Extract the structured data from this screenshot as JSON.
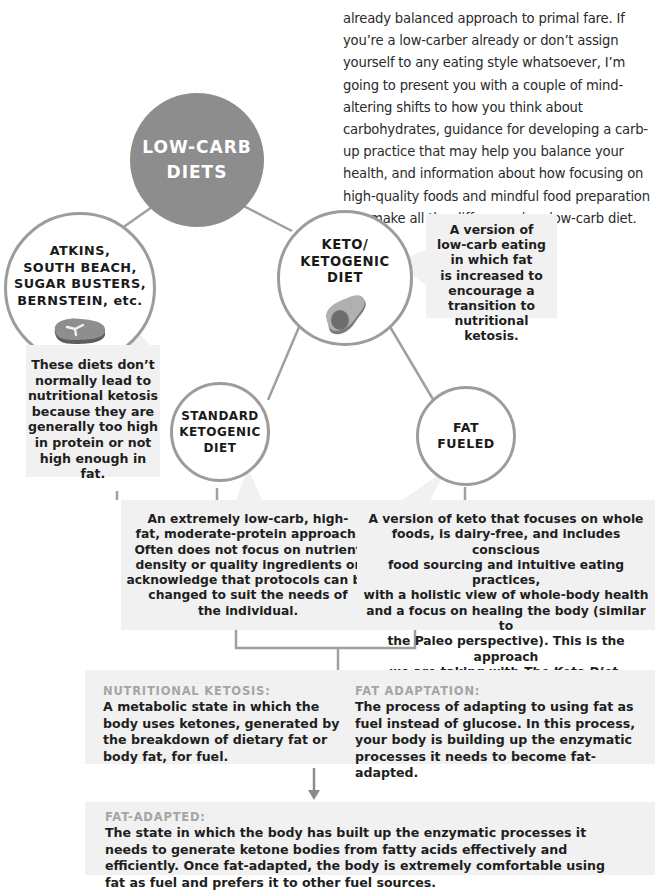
{
  "intro_paragraph": "already balanced approach to primal fare. If you’re a low-carber already or don’t assign yourself to any eating style whatsoever, I’m going to present you with a couple of mind-altering shifts to how you think about carbohydrates, guidance for developing a carb-up practice that may help you balance your health, and information about how focusing on high-quality foods and mindful food preparation can make all the difference in a low-carb diet.",
  "root": {
    "label_line1": "LOW-CARB",
    "label_line2": "DIETS"
  },
  "atkins": {
    "label_lines": [
      "ATKINS,",
      "SOUTH BEACH,",
      "SUGAR BUSTERS,",
      "BERNSTEIN, etc."
    ],
    "icon": "steak-icon",
    "description_lines": [
      "These diets don’t",
      "normally lead to",
      "nutritional ketosis",
      "because they are",
      "generally too high",
      "in protein or not",
      "high enough in fat."
    ]
  },
  "keto": {
    "label_lines": [
      "KETO/",
      "KETOGENIC",
      "DIET"
    ],
    "icon": "avocado-icon",
    "description_lines": [
      "A version of",
      "low-carb eating",
      "in which fat",
      "is increased to",
      "encourage a",
      "transition to",
      "nutritional ketosis."
    ]
  },
  "standard": {
    "label_lines": [
      "STANDARD",
      "KETOGENIC",
      "DIET"
    ],
    "description_lines": [
      "An extremely low-carb, high-",
      "fat, moderate-protein approach.",
      "Often does not focus on nutrient",
      "density or quality ingredients or",
      "acknowledge that protocols can be",
      "changed to suit the needs of",
      "the individual."
    ]
  },
  "fat_fueled": {
    "label_lines": [
      "FAT",
      "FUELED"
    ],
    "description_lines": [
      "A version of keto that focuses on whole",
      "foods, is dairy-free, and includes conscious",
      "food sourcing and intuitive eating practices,",
      "with a holistic view of whole-body health",
      "and a focus on healing the body (similar to",
      "the Paleo perspective). This is the approach"
    ],
    "description_last_prefix": "we are taking with ",
    "description_last_italic": "The Keto Diet",
    "description_last_suffix": "."
  },
  "definitions": {
    "nutritional_ketosis": {
      "title": "NUTRITIONAL KETOSIS:",
      "body": "A metabolic state in which the body uses ketones, generated by the breakdown of dietary fat or body fat, for fuel."
    },
    "fat_adaptation": {
      "title": "FAT ADAPTATION:",
      "body": "The process of adapting to using fat as fuel instead of glucose. In this process, your body is building up the enzymatic processes it needs to become fat-adapted."
    },
    "fat_adapted": {
      "title": "FAT-ADAPTED:",
      "body": "The state in which the body has built up the enzymatic processes it needs to generate ketone bodies from fatty acids effectively and efficiently. Once fat-adapted, the body is extremely comfortable using fat as fuel and prefers it to other fuel sources."
    }
  },
  "colors": {
    "root_fill": "#8d8d8d",
    "outline": "#9c9c9c",
    "box_fill": "#f1f1f1",
    "def_title": "#a5a5a5",
    "text": "#1e1e1e"
  }
}
